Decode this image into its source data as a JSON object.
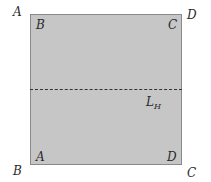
{
  "diagram": {
    "type": "folded-square",
    "fill_color": "#c6c6c6",
    "border_color": "#8a8a8a",
    "outer_labels": {
      "top_left": "A",
      "top_right": "D",
      "bottom_left": "B",
      "bottom_right": "C"
    },
    "inner_labels": {
      "top_left": "B",
      "top_right": "C",
      "bottom_left": "A",
      "bottom_right": "D"
    },
    "fold_line": {
      "style": "dashed",
      "orientation": "horizontal",
      "label_main": "L",
      "label_sub": "H"
    }
  }
}
